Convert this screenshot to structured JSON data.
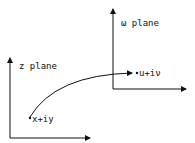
{
  "z_plane": {
    "title": "z plane",
    "point_label": "x+iy"
  },
  "w_plane": {
    "title": "ω plane",
    "point_label": "u+iν"
  },
  "colors": {
    "ink": "#111111",
    "background": "#ffffff"
  }
}
